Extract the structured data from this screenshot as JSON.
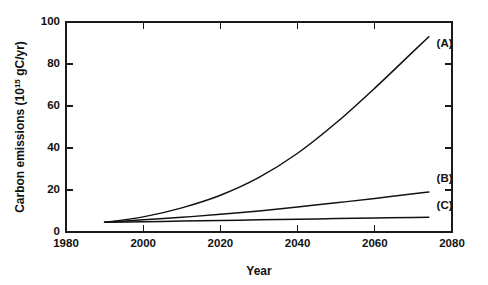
{
  "chart_data": {
    "type": "line",
    "title": "",
    "xlabel": "Year",
    "ylabel": "Carbon emissions (10^15 gC/yr)",
    "ylabel_main": "Carbon emissions (10",
    "ylabel_exponent": "15",
    "ylabel_tail": " gC/yr)",
    "xlim": [
      1980,
      2080
    ],
    "ylim": [
      0,
      100
    ],
    "xticks": [
      1980,
      2000,
      2020,
      2040,
      2060,
      2080
    ],
    "yticks": [
      0,
      20,
      40,
      60,
      80,
      100
    ],
    "grid": false,
    "legend_position": "inline-end-of-curve",
    "series": [
      {
        "name": "(A)",
        "label": "(A)",
        "label_x": 2076,
        "label_y": 88,
        "x": [
          1990,
          2000,
          2010,
          2020,
          2030,
          2040,
          2050,
          2060,
          2070,
          2074
        ],
        "y": [
          4.6,
          7.2,
          11.5,
          17.5,
          26.0,
          37.5,
          52.0,
          68.5,
          86.0,
          93.0
        ]
      },
      {
        "name": "(B)",
        "label": "(B)",
        "label_x": 2076,
        "label_y": 24,
        "x": [
          1990,
          2000,
          2010,
          2020,
          2030,
          2040,
          2050,
          2060,
          2070,
          2074
        ],
        "y": [
          4.6,
          5.8,
          7.0,
          8.4,
          10.0,
          11.9,
          13.9,
          16.0,
          18.2,
          19.0
        ]
      },
      {
        "name": "(C)",
        "label": "(C)",
        "label_x": 2076,
        "label_y": 11,
        "x": [
          1990,
          2000,
          2010,
          2020,
          2030,
          2040,
          2050,
          2060,
          2070,
          2074
        ],
        "y": [
          4.6,
          4.9,
          5.2,
          5.5,
          5.8,
          6.1,
          6.4,
          6.7,
          6.9,
          7.0
        ]
      }
    ]
  }
}
